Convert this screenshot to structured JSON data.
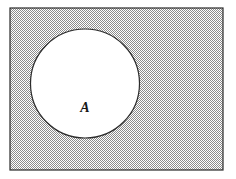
{
  "figure": {
    "kind": "venn-diagram",
    "title_text": "",
    "canvas": {
      "width": 236,
      "height": 179,
      "background": "#ffffff"
    },
    "universe_rect": {
      "name": "universal-set-rectangle",
      "x": 10,
      "y": 8,
      "width": 213,
      "height": 162,
      "stroke": "#2b2b2b",
      "stroke_width": 1.2,
      "fill_style": "checkerboard-stipple",
      "fill_color": "#8f8f8f",
      "label": ""
    },
    "sets": [
      {
        "name": "set-a-circle",
        "label": "A",
        "cx": 85,
        "cy": 83.5,
        "r": 54.5,
        "fill": "#ffffff",
        "stroke": "#2b2b2b",
        "stroke_width": 1.2,
        "label_x": 85,
        "label_y": 109
      }
    ],
    "shaded_region_meaning": "complement-of-A"
  }
}
